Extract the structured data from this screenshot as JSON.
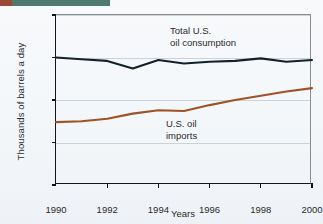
{
  "decor": {
    "top_band_left_color": "#9a4a33",
    "top_band_right_color": "#4f7a72"
  },
  "chart_data": {
    "type": "line",
    "title": "",
    "xlabel": "Years",
    "ylabel": "Thousands of barrels a day",
    "xlim": [
      1990,
      2000
    ],
    "ylim": [
      0,
      20000
    ],
    "grid": true,
    "legend_position": "inline-annotations",
    "x": [
      1990,
      1991,
      1992,
      1993,
      1994,
      1995,
      1996,
      1997,
      1998,
      1999,
      2000
    ],
    "xticks": [
      1990,
      1992,
      1994,
      1996,
      1998,
      2000
    ],
    "xtick_labels": [
      "1990",
      "1992",
      "1994",
      "1996",
      "1998",
      "2000"
    ],
    "yticks": [
      0,
      5000,
      10000,
      15000,
      20000
    ],
    "ytick_labels": [
      "0",
      "5,000",
      "10,000",
      "15,000",
      "20,000"
    ],
    "series": [
      {
        "name": "Total U.S. oil consumption",
        "label_line1": "Total U.S.",
        "label_line2": "oil consumption",
        "color": "#12212e",
        "values": [
          15000,
          14800,
          14600,
          13700,
          14700,
          14300,
          14500,
          14600,
          14900,
          14500,
          14700
        ]
      },
      {
        "name": "U.S. oil imports",
        "label_line1": "U.S. oil",
        "label_line2": "imports",
        "color": "#9e5326",
        "values": [
          7400,
          7500,
          7800,
          8400,
          8800,
          8700,
          9400,
          10000,
          10500,
          11000,
          11400
        ]
      }
    ]
  }
}
